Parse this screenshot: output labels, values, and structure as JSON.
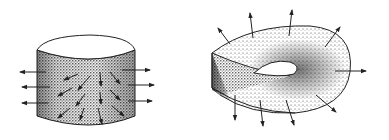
{
  "diagram": {
    "figures": [
      {
        "id": "cylinder",
        "description": "Cylinder surface with outward-pointing normal vectors on the side and arrows spread across the shaded face",
        "normal_arrows_left": 3,
        "normal_arrows_right": 3,
        "surface_arrows": 11
      },
      {
        "id": "mobius-strip",
        "description": "Mobius strip with normal vectors pointing outward from its surface",
        "normal_arrows": 9
      }
    ],
    "colors": {
      "ink": "#222222",
      "shading": "#555555",
      "background": "#ffffff"
    }
  }
}
